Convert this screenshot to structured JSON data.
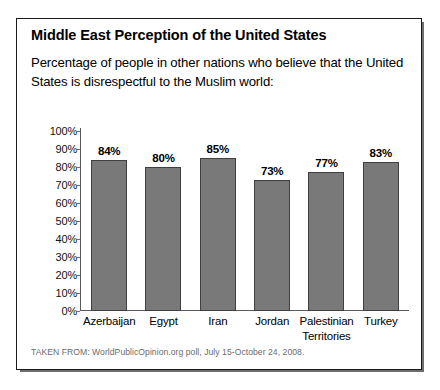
{
  "panel": {
    "title": "Middle East Perception of the United States",
    "subtitle": "Percentage of people in other nations who believe that the United States is disrespectful to the Muslim world:",
    "source": "TAKEN FROM: WorldPublicOpinion.org poll, July 15-October 24, 2008."
  },
  "colors": {
    "bar_fill": "#797979",
    "bar_stroke": "#3f3f3f",
    "axis": "#5a5a5a",
    "border": "#1a1a1a",
    "text": "#000000",
    "source_text": "#6b6b6b"
  },
  "chart_data": {
    "type": "bar",
    "title": "Middle East Perception of the United States",
    "subtitle": "Percentage of people in other nations who believe that the United States is disrespectful to the Muslim world:",
    "categories": [
      "Azerbaijan",
      "Egypt",
      "Iran",
      "Jordan",
      "Palestinian Territories",
      "Turkey"
    ],
    "values": [
      84,
      80,
      85,
      73,
      77,
      83
    ],
    "value_labels": [
      "84%",
      "80%",
      "85%",
      "73%",
      "77%",
      "83%"
    ],
    "xlabel": "",
    "ylabel": "",
    "ylim": [
      0,
      100
    ],
    "ytick_labels": [
      "100%",
      "90%",
      "80%",
      "70%",
      "60%",
      "50%",
      "40%",
      "30%",
      "20%",
      "10%",
      "0%"
    ],
    "ytick_values": [
      100,
      90,
      80,
      70,
      60,
      50,
      40,
      30,
      20,
      10,
      0
    ],
    "grid": false,
    "legend": false,
    "unit": "%",
    "source": "TAKEN FROM: WorldPublicOpinion.org poll, July 15-October 24, 2008."
  }
}
